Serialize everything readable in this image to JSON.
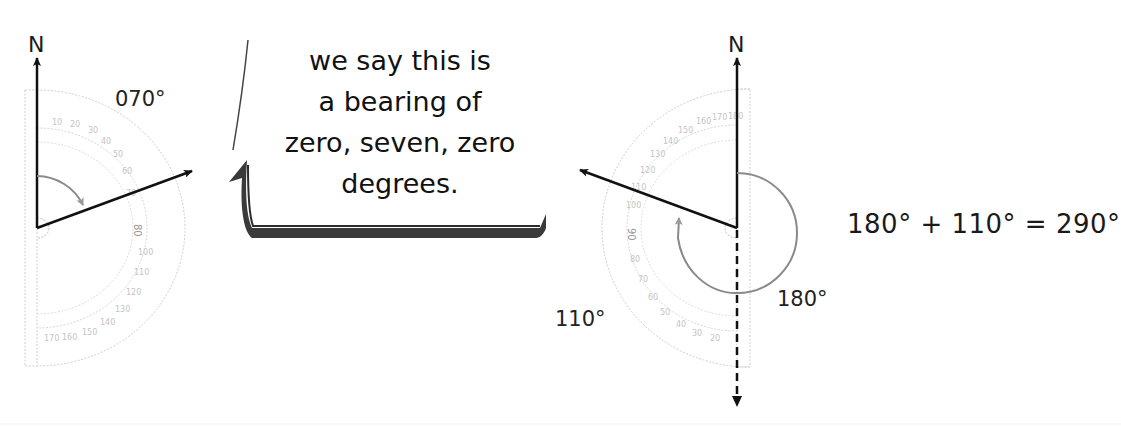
{
  "header_partial": "g    g",
  "left_diagram": {
    "north_label": "N",
    "bearing_label": "070°",
    "arrow_angle_deg": 70,
    "protractor_facing": "right"
  },
  "speech_bubble": {
    "lines": [
      "we say this is",
      "a bearing of",
      "zero, seven, zero",
      "degrees."
    ]
  },
  "right_diagram": {
    "north_label": "N",
    "angle_180_label": "180°",
    "angle_110_label": "110°",
    "arrow_bearing_deg": 290,
    "protractor_facing": "left"
  },
  "equation": "180° + 110° = 290°",
  "colors": {
    "line": "#111111",
    "arc": "#8a8a8a",
    "protractor": "#c8c8c8",
    "bubble_shadow": "#3a3a3a"
  }
}
